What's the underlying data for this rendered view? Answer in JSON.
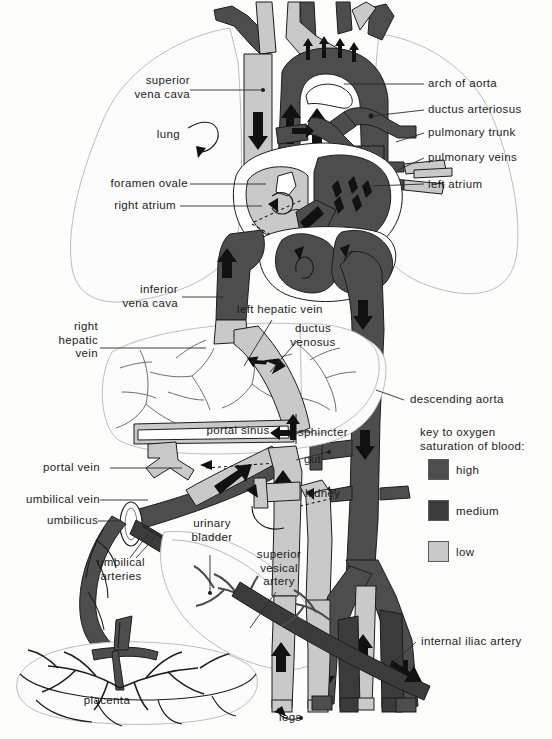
{
  "figure": {
    "type": "anatomical-diagram"
  },
  "colors": {
    "high": "#4d4d4d",
    "medium": "#3b3b3b",
    "low": "#c9c9c9",
    "outline": "#1c1c1c",
    "paper": "#fdfdfc",
    "faint": "#b8b8b8"
  },
  "labels": {
    "superior_vena_cava": "superior\nvena cava",
    "superior_vena_cava_l1": "superior",
    "superior_vena_cava_l2": "vena cava",
    "lung": "lung",
    "foramen_ovale": "foramen ovale",
    "right_atrium": "right atrium",
    "inferior_vena_cava_l1": "inferior",
    "inferior_vena_cava_l2": "vena cava",
    "right_hepatic_vein_l1": "right",
    "right_hepatic_vein_l2": "hepatic",
    "right_hepatic_vein_l3": "vein",
    "portal_vein": "portal vein",
    "umbilical_vein": "umbilical vein",
    "umbilicus": "umbilicus",
    "umbilical_arteries_l1": "umbilical",
    "umbilical_arteries_l2": "arteries",
    "placenta": "placenta",
    "urinary_bladder_l1": "urinary",
    "urinary_bladder_l2": "bladder",
    "superior_vesical_artery_l1": "superior",
    "superior_vesical_artery_l2": "vesical",
    "superior_vesical_artery_l3": "artery",
    "left_hepatic_vein": "left hepatic vein",
    "ductus_venosus_l1": "ductus",
    "ductus_venosus_l2": "venosus",
    "portal_sinus": "portal sinus",
    "sphincter": "sphincter",
    "gut": "gut",
    "kidney": "kidney",
    "legs": "legs",
    "arch_of_aorta": "arch of aorta",
    "ductus_arteriosus": "ductus arteriosus",
    "pulmonary_trunk": "pulmonary trunk",
    "pulmonary_veins": "pulmonary veins",
    "left_atrium": "left atrium",
    "descending_aorta": "descending aorta",
    "internal_iliac_artery": "internal iliac artery"
  },
  "key": {
    "title_l1": "key to oxygen",
    "title_l2": "saturation of blood:",
    "entries": [
      {
        "label": "high",
        "color": "#4d4d4d"
      },
      {
        "label": "medium",
        "color": "#3b3b3b"
      },
      {
        "label": "low",
        "color": "#c9c9c9"
      }
    ]
  }
}
